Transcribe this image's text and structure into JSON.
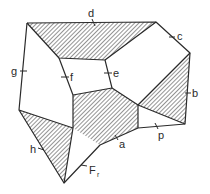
{
  "diagram": {
    "title": "",
    "colors": {
      "stroke": "#2a2a2a",
      "background": "#ffffff",
      "hatch": "#3a3a3a"
    },
    "vertices": {
      "A": [
        27,
        23
      ],
      "B": [
        156,
        22
      ],
      "C": [
        190,
        53
      ],
      "D": [
        185,
        124
      ],
      "E": [
        59,
        58
      ],
      "F": [
        105,
        60
      ],
      "G": [
        112,
        88
      ],
      "H": [
        73,
        95
      ],
      "I": [
        138,
        105
      ],
      "J": [
        138,
        128
      ],
      "K": [
        100,
        145
      ],
      "L": [
        73,
        128
      ],
      "M": [
        19,
        110
      ],
      "N": [
        64,
        183
      ]
    },
    "shaded_regions": [
      {
        "name": "top-trapezoid",
        "vertices": [
          "A",
          "B",
          "F",
          "E"
        ]
      },
      {
        "name": "center-hexagon",
        "vertices": [
          "H",
          "G",
          "I",
          "J",
          "K",
          "L"
        ]
      },
      {
        "name": "right-triangle",
        "vertices": [
          "C",
          "I",
          "D"
        ]
      },
      {
        "name": "left-triangle",
        "vertices": [
          "M",
          "L",
          "N"
        ]
      }
    ],
    "edges": [
      {
        "id": "d",
        "label": "d",
        "from": "A",
        "to": "B"
      },
      {
        "id": "c",
        "label": "c",
        "from": "B",
        "to": "C"
      },
      {
        "id": "b",
        "label": "b",
        "from": "C",
        "to": "D"
      },
      {
        "id": "p",
        "label": "p",
        "from": "J",
        "to": "D"
      },
      {
        "id": "a",
        "label": "a",
        "from": "J",
        "to": "K"
      },
      {
        "id": "Fr",
        "label": "F",
        "label_sub": "r",
        "from": "K",
        "to": "N"
      },
      {
        "id": "h",
        "label": "h",
        "from": "M",
        "to": "N"
      },
      {
        "id": "g",
        "label": "g",
        "from": "A",
        "to": "M"
      },
      {
        "id": "f",
        "label": "f",
        "from": "E",
        "to": "H"
      },
      {
        "id": "e",
        "label": "e",
        "from": "F",
        "to": "G"
      }
    ],
    "labels": {
      "d": "d",
      "c": "c",
      "b": "b",
      "p": "p",
      "a": "a",
      "F": "F",
      "r": "r",
      "h": "h",
      "g": "g",
      "f": "f",
      "e": "e"
    }
  }
}
